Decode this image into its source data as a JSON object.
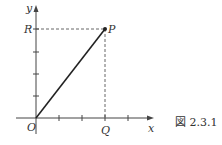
{
  "figure": {
    "caption": "図 2.3.1",
    "axes": {
      "x_label": "x",
      "y_label": "y",
      "origin_label": "O"
    },
    "points": {
      "P": "P",
      "Q": "Q",
      "R": "R"
    },
    "geometry": {
      "origin": [
        36,
        118
      ],
      "P": [
        105,
        29
      ],
      "x_ticks": [
        59,
        82,
        105,
        128
      ],
      "y_ticks": [
        96,
        74,
        52,
        29
      ]
    }
  }
}
